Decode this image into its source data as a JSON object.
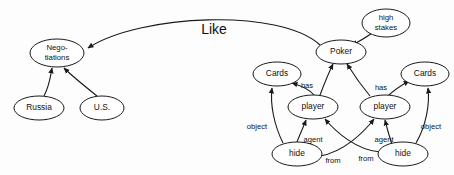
{
  "diagram": {
    "title_label": "Like",
    "nodes": [
      {
        "id": "negotiations",
        "lines": [
          "Nego-",
          "tiations"
        ],
        "cx": 57,
        "cy": 53,
        "rx": 27,
        "ry": 14,
        "font": "sz-9"
      },
      {
        "id": "russia",
        "lines": [
          "Russia"
        ],
        "cx": 39,
        "cy": 108,
        "rx": 25,
        "ry": 12,
        "font": "sz-10"
      },
      {
        "id": "us",
        "lines": [
          "U.S."
        ],
        "cx": 102,
        "cy": 108,
        "rx": 22,
        "ry": 12,
        "font": "sz-10"
      },
      {
        "id": "poker",
        "lines": [
          "Poker"
        ],
        "cx": 341,
        "cy": 52,
        "rx": 25,
        "ry": 12,
        "font": "sz-10"
      },
      {
        "id": "high-stakes",
        "lines": [
          "high",
          "stakes"
        ],
        "cx": 386,
        "cy": 23,
        "rx": 24,
        "ry": 14,
        "font": "sz-9"
      },
      {
        "id": "cards-left",
        "lines": [
          "Cards"
        ],
        "cx": 277,
        "cy": 74,
        "rx": 24,
        "ry": 12,
        "font": "sz-10"
      },
      {
        "id": "cards-right",
        "lines": [
          "Cards"
        ],
        "cx": 425,
        "cy": 74,
        "rx": 24,
        "ry": 12,
        "font": "sz-10"
      },
      {
        "id": "player-left",
        "lines": [
          "player"
        ],
        "cx": 313,
        "cy": 107,
        "rx": 25,
        "ry": 12,
        "font": "sz-10"
      },
      {
        "id": "player-right",
        "lines": [
          "player"
        ],
        "cx": 385,
        "cy": 107,
        "rx": 25,
        "ry": 12,
        "font": "sz-10"
      },
      {
        "id": "hide-left",
        "lines": [
          "hide"
        ],
        "cx": 297,
        "cy": 154,
        "rx": 25,
        "ry": 12,
        "font": "sz-10"
      },
      {
        "id": "hide-right",
        "lines": [
          "hide"
        ],
        "cx": 403,
        "cy": 154,
        "rx": 25,
        "ry": 12,
        "font": "sz-10"
      }
    ],
    "edge_labels": [
      {
        "id": "like",
        "text": "Like",
        "x": 214,
        "y": 30
      },
      {
        "id": "has-left",
        "text": "has",
        "x": 307,
        "y": 86
      },
      {
        "id": "has-right",
        "text": "has",
        "x": 381,
        "y": 88
      },
      {
        "id": "object-left",
        "text": "object",
        "x": 257,
        "y": 127
      },
      {
        "id": "object-right",
        "text": "object",
        "x": 431,
        "y": 127
      },
      {
        "id": "agent-left",
        "text": "agent",
        "x": 313,
        "y": 140
      },
      {
        "id": "agent-right",
        "text": "agent",
        "x": 384,
        "y": 140
      },
      {
        "id": "from-left",
        "text": "from",
        "x": 333,
        "y": 161
      },
      {
        "id": "from-right",
        "text": "from",
        "x": 366,
        "y": 159
      }
    ]
  }
}
